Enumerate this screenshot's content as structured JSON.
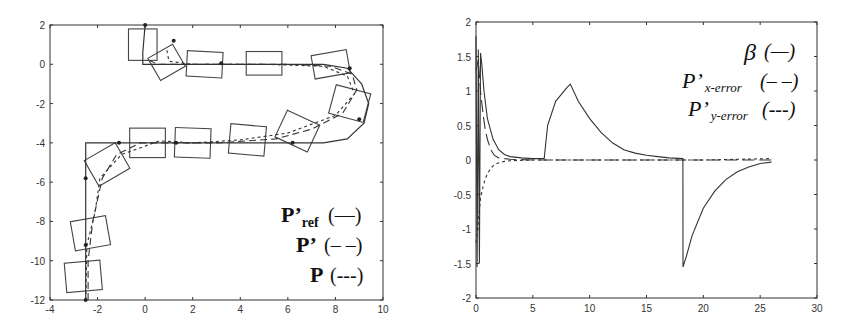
{
  "chart_data": [
    {
      "type": "line",
      "title": "",
      "xlabel": "",
      "ylabel": "",
      "xlim": [
        -4,
        10
      ],
      "ylim": [
        -12,
        2
      ],
      "x_ticks": [
        "-4",
        "-2",
        "0",
        "2",
        "4",
        "6",
        "8",
        "10"
      ],
      "y_ticks": [
        "2",
        "0",
        "-2",
        "-4",
        "-6",
        "-8",
        "-10",
        "-12"
      ],
      "grid": false,
      "legend_position": "lower right (inside)",
      "legend": [
        {
          "label": "P'",
          "sub": "ref",
          "style": "(—)"
        },
        {
          "label": "P'",
          "sub": "",
          "style": "(– –)"
        },
        {
          "label": "P",
          "sub": "",
          "style": "(---)"
        }
      ],
      "series": [
        {
          "name": "P'_ref",
          "style": "solid",
          "points": [
            [
              -2.5,
              -12
            ],
            [
              -2.5,
              -4
            ],
            [
              7.5,
              -4
            ],
            [
              8.5,
              -3.8
            ],
            [
              9.2,
              -3.0
            ],
            [
              9.4,
              -2.0
            ],
            [
              9.1,
              -1.0
            ],
            [
              8.5,
              -0.2
            ],
            [
              7.5,
              0
            ],
            [
              -0.1,
              0
            ],
            [
              -0.1,
              0.6
            ],
            [
              0,
              2
            ]
          ]
        },
        {
          "name": "P'",
          "style": "dashed",
          "points": [
            [
              -2.4,
              -12
            ],
            [
              -2.4,
              -10
            ],
            [
              -2.2,
              -8
            ],
            [
              -1.8,
              -5.8
            ],
            [
              -1.2,
              -4.6
            ],
            [
              -0.2,
              -4
            ],
            [
              3,
              -4
            ],
            [
              5.5,
              -3.8
            ],
            [
              7,
              -3.3
            ],
            [
              8.3,
              -2.5
            ],
            [
              8.9,
              -1.3
            ],
            [
              8.7,
              -0.5
            ],
            [
              7.8,
              -0.1
            ],
            [
              6,
              0
            ],
            [
              2,
              0
            ],
            [
              0.5,
              0
            ],
            [
              0.2,
              0.2
            ]
          ]
        },
        {
          "name": "P",
          "style": "dotted",
          "points": [
            [
              -2.5,
              -12
            ],
            [
              -2.45,
              -9.2
            ],
            [
              -2.1,
              -7.5
            ],
            [
              -1.9,
              -5.8
            ],
            [
              -1.0,
              -4.6
            ],
            [
              0.6,
              -3.9
            ],
            [
              2,
              -4
            ],
            [
              4,
              -3.85
            ],
            [
              6,
              -3.5
            ],
            [
              8,
              -2.6
            ],
            [
              8.8,
              -1.5
            ],
            [
              8.5,
              -0.6
            ],
            [
              7.5,
              -0.1
            ],
            [
              5,
              0
            ],
            [
              2,
              0
            ],
            [
              1,
              0.15
            ],
            [
              0.9,
              0.8
            ]
          ]
        }
      ],
      "vehicle_boxes": [
        {
          "cx": -2.6,
          "cy": -10.8,
          "w": 1.5,
          "h": 1.5,
          "angle": 5
        },
        {
          "cx": -2.3,
          "cy": -8.6,
          "w": 1.5,
          "h": 1.5,
          "angle": 10
        },
        {
          "cx": -1.6,
          "cy": -5.1,
          "w": 1.5,
          "h": 1.5,
          "angle": 30
        },
        {
          "cx": 0.1,
          "cy": -4.0,
          "w": 1.5,
          "h": 1.5,
          "angle": 0
        },
        {
          "cx": 2.0,
          "cy": -4.0,
          "w": 1.5,
          "h": 1.5,
          "angle": -2
        },
        {
          "cx": 4.3,
          "cy": -3.85,
          "w": 1.5,
          "h": 1.5,
          "angle": -5
        },
        {
          "cx": 6.4,
          "cy": -3.4,
          "w": 1.5,
          "h": 1.5,
          "angle": -25
        },
        {
          "cx": 8.6,
          "cy": -2.0,
          "w": 1.5,
          "h": 1.5,
          "angle": -15
        },
        {
          "cx": 7.8,
          "cy": 0.0,
          "w": 1.5,
          "h": 1.2,
          "angle": 10
        },
        {
          "cx": 5.0,
          "cy": 0.05,
          "w": 1.5,
          "h": 1.2,
          "angle": 0
        },
        {
          "cx": 2.5,
          "cy": 0.0,
          "w": 1.5,
          "h": 1.3,
          "angle": -3
        },
        {
          "cx": 0.9,
          "cy": 0.1,
          "w": 1.2,
          "h": 1.3,
          "angle": 30
        },
        {
          "cx": -0.1,
          "cy": 1.0,
          "w": 1.2,
          "h": 1.6,
          "angle": 0
        }
      ]
    },
    {
      "type": "line",
      "title": "",
      "xlabel": "",
      "ylabel": "",
      "xlim": [
        0,
        30
      ],
      "ylim": [
        -2,
        2
      ],
      "x_ticks": [
        "0",
        "5",
        "10",
        "15",
        "20",
        "25",
        "30"
      ],
      "y_ticks": [
        "2",
        "1.5",
        "1",
        "0.5",
        "0",
        "-0.5",
        "-1",
        "-1.5",
        "-2"
      ],
      "grid": false,
      "legend_position": "upper right (inside)",
      "legend": [
        {
          "label": "β",
          "sub": "",
          "style": "(—)"
        },
        {
          "label": "P'",
          "sub": "x-error",
          "style": "(– –)"
        },
        {
          "label": "P'",
          "sub": "y-error",
          "style": "(---)"
        }
      ],
      "series": [
        {
          "name": "beta",
          "style": "solid",
          "x": [
            0,
            0.1,
            0.2,
            0.3,
            0.4,
            0.5,
            0.7,
            1.0,
            1.5,
            2.0,
            2.5,
            3.0,
            4.0,
            5.0,
            5.9,
            6.0,
            6.3,
            7.0,
            8.0,
            8.3,
            9.0,
            10.0,
            11.0,
            12.0,
            13.0,
            14.0,
            15.0,
            16.0,
            17.0,
            18.2,
            18.21,
            18.5,
            19.0,
            20.0,
            21.0,
            22.0,
            23.0,
            24.0,
            25.0,
            26.0
          ],
          "values": [
            1.8,
            -1.55,
            1.6,
            -1.5,
            1.55,
            1.4,
            1.0,
            0.6,
            0.3,
            0.15,
            0.08,
            0.05,
            0.03,
            0.02,
            0.02,
            0.02,
            0.5,
            0.85,
            1.05,
            1.1,
            0.85,
            0.6,
            0.4,
            0.25,
            0.15,
            0.1,
            0.07,
            0.05,
            0.03,
            0.02,
            -1.55,
            -1.4,
            -1.1,
            -0.7,
            -0.45,
            -0.28,
            -0.17,
            -0.1,
            -0.05,
            -0.03
          ]
        },
        {
          "name": "P'_x-error",
          "style": "dashed",
          "x": [
            0,
            0.2,
            0.4,
            0.6,
            0.8,
            1.0,
            1.3,
            1.6,
            2.0,
            3.0,
            5.0,
            10.0,
            15.0,
            20.0,
            26.0
          ],
          "values": [
            1.3,
            1.45,
            1.0,
            0.7,
            0.45,
            0.3,
            0.15,
            0.07,
            0.03,
            0.01,
            0.0,
            0.0,
            0.0,
            0.0,
            0.0
          ]
        },
        {
          "name": "P'_y-error",
          "style": "dotted",
          "x": [
            0,
            0.2,
            0.4,
            0.6,
            0.8,
            1.0,
            1.3,
            1.6,
            2.0,
            2.5,
            3.0,
            5.0,
            10.0,
            15.0,
            20.0,
            26.0
          ],
          "values": [
            -1.2,
            -0.9,
            -0.55,
            -0.4,
            -0.28,
            -0.2,
            -0.12,
            -0.07,
            -0.04,
            -0.02,
            -0.01,
            0.0,
            0.0,
            0.0,
            0.0,
            0.02
          ]
        }
      ]
    }
  ],
  "left_legend": {
    "row1": {
      "main": "P’",
      "sub": "ref",
      "style": "(—)"
    },
    "row2": {
      "main": "P’",
      "style": "(– –)"
    },
    "row3": {
      "main": "P",
      "style": "(---)"
    }
  },
  "right_legend": {
    "row1": {
      "main": "β",
      "style": "(—)"
    },
    "row2": {
      "main": "P’",
      "sub": "x-error",
      "style": "(– –)"
    },
    "row3": {
      "main": "P’",
      "sub": "y-error",
      "style": "(---)"
    }
  }
}
